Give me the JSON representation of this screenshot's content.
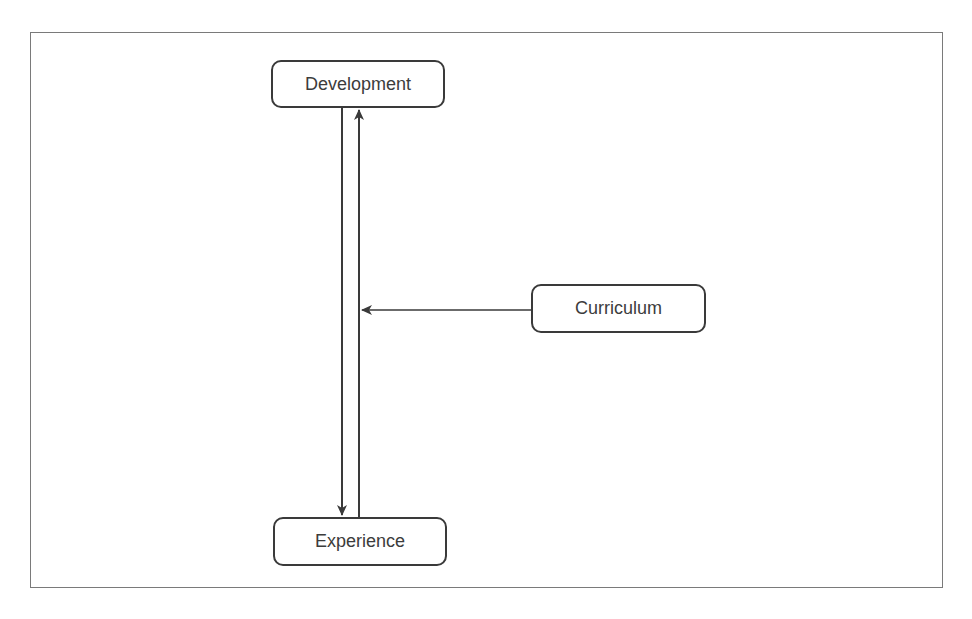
{
  "diagram": {
    "nodes": [
      {
        "id": "development",
        "label": "Development"
      },
      {
        "id": "experience",
        "label": "Experience"
      },
      {
        "id": "curriculum",
        "label": "Curriculum"
      }
    ],
    "edges": [
      {
        "from": "development",
        "to": "experience",
        "direction": "down"
      },
      {
        "from": "experience",
        "to": "development",
        "direction": "up"
      },
      {
        "from": "curriculum",
        "to": "development-experience-link",
        "direction": "left"
      }
    ],
    "colors": {
      "stroke": "#3a3a3a",
      "frame": "#7a7a7a",
      "text": "#3c3c3c",
      "background": "#ffffff"
    }
  }
}
